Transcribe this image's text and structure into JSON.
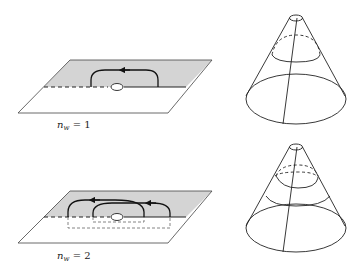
{
  "panels": [
    {
      "id": "top",
      "label_var": "n",
      "label_sub": "w",
      "label_eq": " = ",
      "label_val": "1"
    },
    {
      "id": "bottom",
      "label_var": "n",
      "label_sub": "w",
      "label_eq": " = ",
      "label_val": "2"
    }
  ],
  "colors": {
    "shaded_half_plane": "#d3d3d3",
    "line": "#222222",
    "background": "#ffffff"
  }
}
